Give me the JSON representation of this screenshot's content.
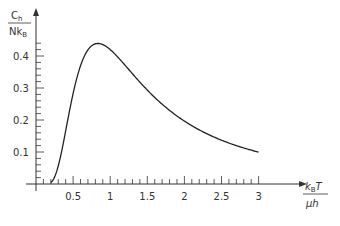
{
  "chart_data": {
    "type": "line",
    "title": "",
    "xlabel": "k_B T / μh",
    "ylabel": "C_h / N k_B",
    "xlim": [
      0,
      3.4
    ],
    "ylim": [
      0,
      0.5
    ],
    "x_ticks": [
      "0.5",
      "1",
      "1.5",
      "2",
      "2.5",
      "3"
    ],
    "y_ticks": [
      "0.1",
      "0.2",
      "0.3",
      "0.4"
    ],
    "grid": false,
    "legend": null,
    "series": [
      {
        "name": "Schottky heat capacity",
        "x": [
          0.2,
          0.3,
          0.4,
          0.5,
          0.6,
          0.7,
          0.8,
          0.9,
          1.0,
          1.2,
          1.4,
          1.6,
          1.8,
          2.0,
          2.2,
          2.4,
          2.6,
          2.8,
          3.0
        ],
        "values": [
          0.0,
          0.04,
          0.16,
          0.28,
          0.37,
          0.42,
          0.44,
          0.44,
          0.42,
          0.38,
          0.34,
          0.29,
          0.25,
          0.21,
          0.18,
          0.16,
          0.14,
          0.12,
          0.105
        ]
      }
    ]
  },
  "labels": {
    "y_num": "C",
    "y_num_sub": "h",
    "y_den": "Nk",
    "y_den_sub": "B",
    "x_num": "k",
    "x_num_sub": "B",
    "x_num_tail": "T",
    "x_den": "μh"
  }
}
